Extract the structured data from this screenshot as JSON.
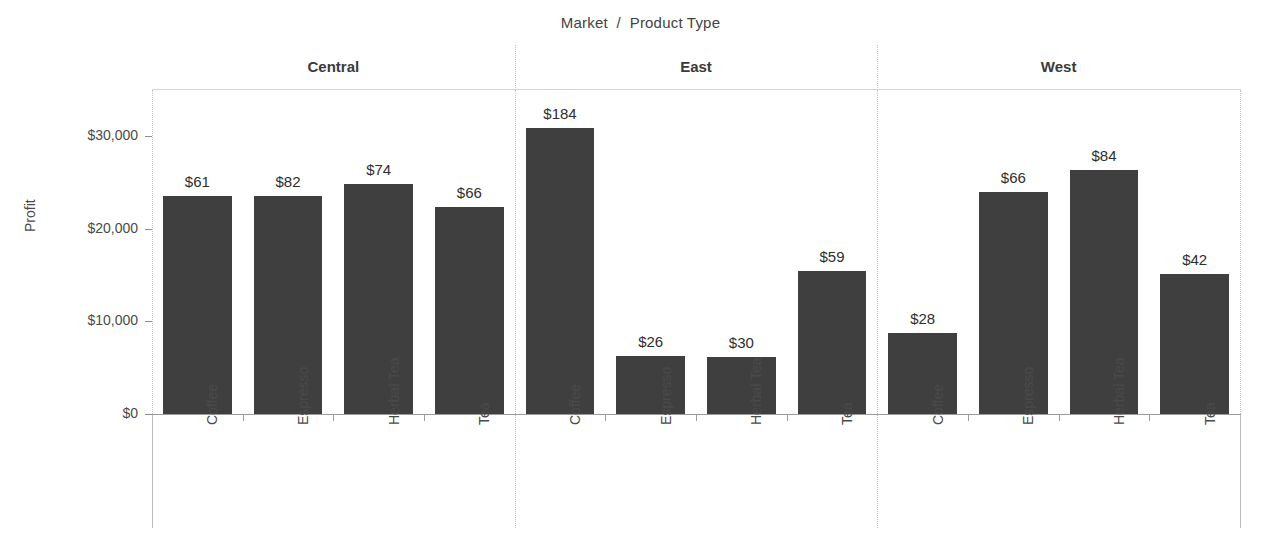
{
  "chart_data": {
    "type": "bar",
    "title": "Market  /  Product Type",
    "xlabel": "",
    "ylabel": "Profit",
    "ylim": [
      0,
      33000
    ],
    "yticks": [
      "$0",
      "$10,000",
      "$20,000",
      "$30,000"
    ],
    "ytick_values": [
      0,
      10000,
      20000,
      30000
    ],
    "grid": false,
    "legend": null,
    "panel_field": "Market",
    "categories": [
      "Coffee",
      "Espresso",
      "Herbal Tea",
      "Tea"
    ],
    "panels": [
      {
        "name": "Central",
        "bars": [
          {
            "category": "Coffee",
            "value": 23520,
            "label": "$61"
          },
          {
            "category": "Espresso",
            "value": 23520,
            "label": "$82"
          },
          {
            "category": "Herbal Tea",
            "value": 24820,
            "label": "$74"
          },
          {
            "category": "Tea",
            "value": 22340,
            "label": "$66"
          }
        ]
      },
      {
        "name": "East",
        "bars": [
          {
            "category": "Coffee",
            "value": 30860,
            "label": "$184"
          },
          {
            "category": "Espresso",
            "value": 6260,
            "label": "$26"
          },
          {
            "category": "Herbal Tea",
            "value": 6150,
            "label": "$30"
          },
          {
            "category": "Tea",
            "value": 15430,
            "label": "$59"
          }
        ]
      },
      {
        "name": "West",
        "bars": [
          {
            "category": "Coffee",
            "value": 8740,
            "label": "$28"
          },
          {
            "category": "Espresso",
            "value": 23960,
            "label": "$66"
          },
          {
            "category": "Herbal Tea",
            "value": 26330,
            "label": "$84"
          },
          {
            "category": "Tea",
            "value": 15110,
            "label": "$42"
          }
        ]
      }
    ],
    "colors": {
      "bar": "#3f3f3f",
      "text": "#434343",
      "axis": "#9a9a9a",
      "grid": "#c4c4c4",
      "background": "#ffffff"
    }
  }
}
